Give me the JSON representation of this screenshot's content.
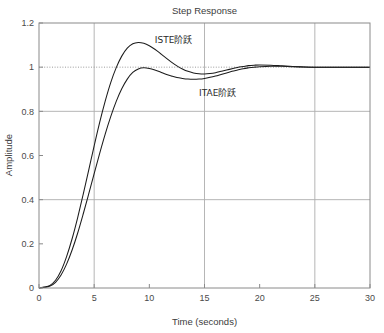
{
  "chart_data": {
    "type": "line",
    "title": "Step Response",
    "xlabel": "Time (seconds)",
    "ylabel": "Amplitude",
    "xlim": [
      0,
      30
    ],
    "ylim": [
      0,
      1.2
    ],
    "xticks": [
      "0",
      "5",
      "10",
      "15",
      "20",
      "25",
      "30"
    ],
    "yticks": [
      "0",
      "0.2",
      "0.4",
      "0.6",
      "0.8",
      "1",
      "1.2"
    ],
    "grid": true,
    "grid_x": [
      5,
      15,
      25
    ],
    "grid_y": [
      0.4,
      0.8
    ],
    "reference_line": {
      "y": 1,
      "style": "dotted"
    },
    "legend_position": "inline-annotations",
    "line_color": "#1c1c1c",
    "grid_color": "#aeaeae",
    "x": [
      0,
      0.5,
      1,
      1.5,
      2,
      2.5,
      3,
      3.5,
      4,
      4.5,
      5,
      5.5,
      6,
      6.5,
      7,
      7.5,
      8,
      8.5,
      9,
      9.5,
      10,
      10.5,
      11,
      11.5,
      12,
      12.5,
      13,
      13.5,
      14,
      14.5,
      15,
      15.5,
      16,
      16.5,
      17,
      17.5,
      18,
      18.5,
      19,
      19.5,
      20,
      21,
      22,
      23,
      24,
      25,
      26,
      27,
      28,
      29,
      30
    ],
    "series": [
      {
        "name": "ISTE阶跃",
        "annotation": "ISTE阶跃",
        "annotation_x": 12.2,
        "annotation_y": 1.125,
        "overshoot": 1.11,
        "peak_time": 8.5,
        "values": [
          0,
          0.004,
          0.012,
          0.035,
          0.078,
          0.142,
          0.223,
          0.318,
          0.423,
          0.533,
          0.644,
          0.75,
          0.846,
          0.93,
          0.998,
          1.05,
          1.086,
          1.106,
          1.112,
          1.108,
          1.097,
          1.081,
          1.062,
          1.042,
          1.023,
          1.006,
          0.992,
          0.981,
          0.974,
          0.97,
          0.969,
          0.971,
          0.975,
          0.981,
          0.987,
          0.993,
          0.999,
          1.003,
          1.007,
          1.009,
          1.01,
          1.009,
          1.006,
          1.003,
          1.001,
          1.0,
          1.0,
          1.0,
          1.0,
          1.0,
          1.0
        ]
      },
      {
        "name": "ITAE阶跃",
        "annotation": "ITAE阶跃",
        "annotation_x": 16.2,
        "annotation_y": 0.885,
        "overshoot": 0.99,
        "peak_time": 10.0,
        "values": [
          0,
          0.003,
          0.009,
          0.026,
          0.059,
          0.108,
          0.172,
          0.248,
          0.334,
          0.425,
          0.518,
          0.61,
          0.697,
          0.776,
          0.845,
          0.902,
          0.946,
          0.976,
          0.992,
          0.997,
          0.994,
          0.987,
          0.978,
          0.968,
          0.96,
          0.953,
          0.949,
          0.946,
          0.945,
          0.946,
          0.949,
          0.954,
          0.96,
          0.967,
          0.974,
          0.981,
          0.987,
          0.993,
          0.997,
          1.0,
          1.002,
          1.004,
          1.004,
          1.002,
          1.001,
          1.0,
          1.0,
          1.0,
          1.0,
          1.0,
          1.0
        ]
      }
    ]
  }
}
